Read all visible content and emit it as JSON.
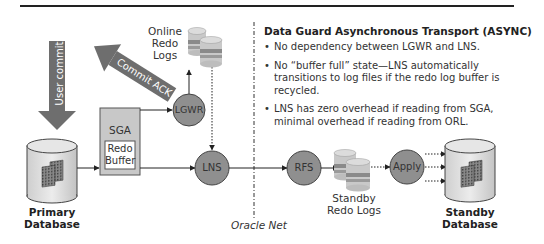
{
  "panel": {
    "title": "Data Guard Asynchronous Transport (ASYNC)",
    "bullets": [
      "No dependency between LGWR and LNS.",
      "No “buffer full” state—LNS automatically transitions to log files if the redo log buffer is recycled.",
      "LNS has zero overhead if reading from SGA, minimal overhead if reading from ORL."
    ]
  },
  "diagram": {
    "user_commit": "User commit",
    "commit_ack": "Commit ACK",
    "online_redo_logs_line1": "Online",
    "online_redo_logs_line2": "Redo Logs",
    "sga": "SGA",
    "redo_buffer_line1": "Redo",
    "redo_buffer_line2": "Buffer",
    "lgwr": "LGWR",
    "lns": "LNS",
    "rfs": "RFS",
    "apply": "Apply",
    "standby_redo_logs_line1": "Standby",
    "standby_redo_logs_line2": "Redo Logs",
    "primary_db_line1": "Primary",
    "primary_db_line2": "Database",
    "standby_db_line1": "Standby",
    "standby_db_line2": "Database",
    "oracle_net": "Oracle Net"
  },
  "colors": {
    "process_circle": "#8f8f8f",
    "arrow_fill": "#6e6e6e",
    "sga_box": "#c8c8c8",
    "db_body": "#d9d9d9"
  }
}
